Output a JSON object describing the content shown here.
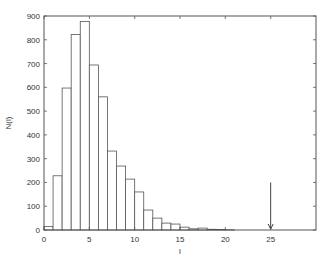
{
  "chart_data": {
    "type": "bar",
    "title": "",
    "xlabel": "l",
    "ylabel": "N(l)",
    "xlim": [
      0,
      30
    ],
    "ylim": [
      0,
      900
    ],
    "grid": false,
    "legend": null,
    "x_ticks": [
      0,
      5,
      10,
      15,
      20,
      25
    ],
    "y_ticks": [
      0,
      100,
      200,
      300,
      400,
      500,
      600,
      700,
      800,
      900
    ],
    "bin_width": 1,
    "bins": [
      {
        "x0": 0,
        "x1": 1,
        "value": 15
      },
      {
        "x0": 1,
        "x1": 2,
        "value": 228
      },
      {
        "x0": 2,
        "x1": 3,
        "value": 597
      },
      {
        "x0": 3,
        "x1": 4,
        "value": 822
      },
      {
        "x0": 4,
        "x1": 5,
        "value": 877
      },
      {
        "x0": 5,
        "x1": 6,
        "value": 694
      },
      {
        "x0": 6,
        "x1": 7,
        "value": 560
      },
      {
        "x0": 7,
        "x1": 8,
        "value": 332
      },
      {
        "x0": 8,
        "x1": 9,
        "value": 269
      },
      {
        "x0": 9,
        "x1": 10,
        "value": 214
      },
      {
        "x0": 10,
        "x1": 11,
        "value": 160
      },
      {
        "x0": 11,
        "x1": 12,
        "value": 84
      },
      {
        "x0": 12,
        "x1": 13,
        "value": 50
      },
      {
        "x0": 13,
        "x1": 14,
        "value": 29
      },
      {
        "x0": 14,
        "x1": 15,
        "value": 25
      },
      {
        "x0": 15,
        "x1": 16,
        "value": 12
      },
      {
        "x0": 16,
        "x1": 17,
        "value": 5
      },
      {
        "x0": 17,
        "x1": 18,
        "value": 8
      },
      {
        "x0": 18,
        "x1": 19,
        "value": 3
      },
      {
        "x0": 19,
        "x1": 20,
        "value": 2
      },
      {
        "x0": 20,
        "x1": 21,
        "value": 1
      }
    ],
    "annotations": [
      {
        "type": "arrow",
        "x": 25,
        "y_from": 200,
        "y_to": 0,
        "direction": "down"
      }
    ]
  }
}
